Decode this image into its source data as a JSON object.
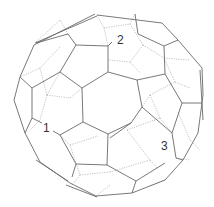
{
  "figure": {
    "labels": [
      {
        "text": "2",
        "x": 117,
        "y": 34
      },
      {
        "text": "1",
        "x": 43,
        "y": 122
      },
      {
        "text": "3",
        "x": 161,
        "y": 140
      }
    ],
    "colors": {
      "edge": "#6a6a6a",
      "hidden_edge": "#9a9a9a",
      "background": "#ffffff"
    },
    "solid_edges": [
      [
        [
          97,
          15
        ],
        [
          162,
          23
        ]
      ],
      [
        [
          97,
          16
        ],
        [
          35,
          43
        ]
      ],
      [
        [
          95,
          14
        ],
        [
          34,
          45
        ]
      ],
      [
        [
          162,
          23
        ],
        [
          178,
          40
        ]
      ],
      [
        [
          178,
          40
        ],
        [
          202,
          68
        ]
      ],
      [
        [
          202,
          68
        ],
        [
          203,
          95
        ]
      ],
      [
        [
          203,
          95
        ],
        [
          198,
          133
        ]
      ],
      [
        [
          200,
          70
        ],
        [
          203,
          120
        ]
      ],
      [
        [
          198,
          133
        ],
        [
          183,
          160
        ]
      ],
      [
        [
          183,
          160
        ],
        [
          165,
          180
        ]
      ],
      [
        [
          165,
          180
        ],
        [
          132,
          193
        ]
      ],
      [
        [
          132,
          193
        ],
        [
          96,
          196
        ]
      ],
      [
        [
          96,
          196
        ],
        [
          70,
          183
        ]
      ],
      [
        [
          70,
          183
        ],
        [
          40,
          162
        ]
      ],
      [
        [
          40,
          162
        ],
        [
          25,
          133
        ]
      ],
      [
        [
          25,
          133
        ],
        [
          14,
          100
        ]
      ],
      [
        [
          14,
          100
        ],
        [
          20,
          77
        ]
      ],
      [
        [
          20,
          77
        ],
        [
          34,
          45
        ]
      ],
      [
        [
          68,
          181
        ],
        [
          36,
          160
        ]
      ],
      [
        [
          97,
          197
        ],
        [
          66,
          185
        ]
      ],
      [
        [
          82,
          88
        ],
        [
          108,
          72
        ]
      ],
      [
        [
          108,
          72
        ],
        [
          137,
          80
        ]
      ],
      [
        [
          137,
          80
        ],
        [
          142,
          107
        ]
      ],
      [
        [
          142,
          107
        ],
        [
          131,
          123
        ]
      ],
      [
        [
          131,
          123
        ],
        [
          108,
          134
        ]
      ],
      [
        [
          108,
          134
        ],
        [
          83,
          122
        ]
      ],
      [
        [
          83,
          122
        ],
        [
          82,
          88
        ]
      ],
      [
        [
          108,
          72
        ],
        [
          108,
          46
        ]
      ],
      [
        [
          108,
          46
        ],
        [
          76,
          45
        ]
      ],
      [
        [
          108,
          46
        ],
        [
          112,
          42
        ]
      ],
      [
        [
          76,
          45
        ],
        [
          68,
          34
        ]
      ],
      [
        [
          68,
          34
        ],
        [
          36,
          43
        ]
      ],
      [
        [
          82,
          88
        ],
        [
          60,
          72
        ]
      ],
      [
        [
          60,
          72
        ],
        [
          76,
          45
        ]
      ],
      [
        [
          60,
          72
        ],
        [
          32,
          88
        ]
      ],
      [
        [
          32,
          88
        ],
        [
          20,
          77
        ]
      ],
      [
        [
          32,
          88
        ],
        [
          32,
          118
        ]
      ],
      [
        [
          32,
          118
        ],
        [
          25,
          133
        ]
      ],
      [
        [
          32,
          118
        ],
        [
          42,
          123
        ]
      ],
      [
        [
          137,
          80
        ],
        [
          165,
          74
        ]
      ],
      [
        [
          165,
          74
        ],
        [
          164,
          46
        ]
      ],
      [
        [
          164,
          46
        ],
        [
          138,
          34
        ]
      ],
      [
        [
          138,
          34
        ],
        [
          135,
          14
        ]
      ],
      [
        [
          164,
          46
        ],
        [
          178,
          40
        ]
      ],
      [
        [
          165,
          74
        ],
        [
          182,
          103
        ]
      ],
      [
        [
          182,
          103
        ],
        [
          202,
          103
        ]
      ],
      [
        [
          182,
          103
        ],
        [
          172,
          133
        ]
      ],
      [
        [
          142,
          107
        ],
        [
          172,
          133
        ]
      ],
      [
        [
          172,
          133
        ],
        [
          176,
          158
        ]
      ],
      [
        [
          176,
          158
        ],
        [
          183,
          160
        ]
      ],
      [
        [
          131,
          123
        ],
        [
          110,
          138
        ]
      ],
      [
        [
          108,
          134
        ],
        [
          107,
          165
        ]
      ],
      [
        [
          107,
          165
        ],
        [
          136,
          181
        ]
      ],
      [
        [
          136,
          181
        ],
        [
          157,
          168
        ]
      ],
      [
        [
          157,
          168
        ],
        [
          165,
          163
        ]
      ],
      [
        [
          107,
          165
        ],
        [
          76,
          164
        ]
      ],
      [
        [
          76,
          164
        ],
        [
          60,
          135
        ]
      ],
      [
        [
          60,
          135
        ],
        [
          53,
          131
        ]
      ],
      [
        [
          83,
          122
        ],
        [
          60,
          135
        ]
      ],
      [
        [
          76,
          164
        ],
        [
          72,
          177
        ]
      ],
      [
        [
          136,
          181
        ],
        [
          132,
          193
        ]
      ]
    ],
    "hidden_edges": [
      [
        [
          97,
          15
        ],
        [
          104,
          28
        ]
      ],
      [
        [
          104,
          28
        ],
        [
          130,
          24
        ]
      ],
      [
        [
          130,
          24
        ],
        [
          135,
          14
        ]
      ],
      [
        [
          104,
          28
        ],
        [
          108,
          46
        ]
      ],
      [
        [
          130,
          24
        ],
        [
          143,
          45
        ]
      ],
      [
        [
          143,
          45
        ],
        [
          164,
          58
        ]
      ],
      [
        [
          143,
          45
        ],
        [
          130,
          62
        ]
      ],
      [
        [
          130,
          62
        ],
        [
          108,
          60
        ]
      ],
      [
        [
          130,
          62
        ],
        [
          140,
          73
        ]
      ],
      [
        [
          68,
          34
        ],
        [
          60,
          20
        ]
      ],
      [
        [
          60,
          20
        ],
        [
          35,
          43
        ]
      ],
      [
        [
          60,
          47
        ],
        [
          40,
          68
        ]
      ],
      [
        [
          40,
          68
        ],
        [
          20,
          77
        ]
      ],
      [
        [
          40,
          68
        ],
        [
          47,
          95
        ]
      ],
      [
        [
          47,
          95
        ],
        [
          60,
          72
        ]
      ],
      [
        [
          47,
          95
        ],
        [
          70,
          98
        ]
      ],
      [
        [
          70,
          98
        ],
        [
          82,
          88
        ]
      ],
      [
        [
          47,
          95
        ],
        [
          40,
          120
        ]
      ],
      [
        [
          40,
          120
        ],
        [
          30,
          130
        ]
      ],
      [
        [
          60,
          135
        ],
        [
          70,
          145
        ]
      ],
      [
        [
          70,
          145
        ],
        [
          98,
          136
        ]
      ],
      [
        [
          70,
          145
        ],
        [
          80,
          175
        ]
      ],
      [
        [
          80,
          175
        ],
        [
          72,
          185
        ]
      ],
      [
        [
          80,
          175
        ],
        [
          110,
          172
        ]
      ],
      [
        [
          110,
          172
        ],
        [
          150,
          160
        ]
      ],
      [
        [
          150,
          160
        ],
        [
          157,
          168
        ]
      ],
      [
        [
          127,
          130
        ],
        [
          150,
          160
        ]
      ],
      [
        [
          127,
          130
        ],
        [
          160,
          118
        ]
      ],
      [
        [
          160,
          118
        ],
        [
          172,
          133
        ]
      ],
      [
        [
          160,
          118
        ],
        [
          150,
          95
        ]
      ],
      [
        [
          150,
          95
        ],
        [
          142,
          107
        ]
      ],
      [
        [
          150,
          95
        ],
        [
          175,
          82
        ]
      ],
      [
        [
          175,
          82
        ],
        [
          190,
          88
        ]
      ],
      [
        [
          175,
          82
        ],
        [
          164,
          58
        ]
      ],
      [
        [
          164,
          58
        ],
        [
          190,
          60
        ]
      ],
      [
        [
          178,
          112
        ],
        [
          190,
          140
        ]
      ],
      [
        [
          190,
          140
        ],
        [
          200,
          150
        ]
      ],
      [
        [
          176,
          158
        ],
        [
          190,
          160
        ]
      ],
      [
        [
          165,
          180
        ],
        [
          150,
          186
        ]
      ],
      [
        [
          110,
          185
        ],
        [
          96,
          196
        ]
      ]
    ]
  }
}
